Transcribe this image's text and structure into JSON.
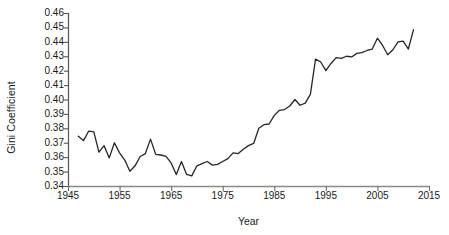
{
  "chart_data": {
    "type": "line",
    "title": "",
    "xlabel": "Year",
    "ylabel": "Gini Coefficient",
    "xlim": [
      1945,
      2015
    ],
    "ylim": [
      0.34,
      0.46
    ],
    "grid": false,
    "legend": "none",
    "xticks": [
      1945,
      1955,
      1965,
      1975,
      1985,
      1995,
      2005,
      2015
    ],
    "yticks": [
      "0.34",
      "0.35",
      "0.36",
      "0.37",
      "0.38",
      "0.39",
      "0.40",
      "0.41",
      "0.42",
      "0.43",
      "0.44",
      "0.45",
      "0.46"
    ],
    "line_color": "#262626",
    "line_width": 1.3,
    "series": [
      {
        "name": "Gini Coefficient",
        "x": [
          1947,
          1948,
          1949,
          1950,
          1951,
          1952,
          1953,
          1954,
          1955,
          1956,
          1957,
          1958,
          1959,
          1960,
          1961,
          1962,
          1963,
          1964,
          1965,
          1966,
          1967,
          1968,
          1969,
          1970,
          1971,
          1972,
          1973,
          1974,
          1975,
          1976,
          1977,
          1978,
          1979,
          1980,
          1981,
          1982,
          1983,
          1984,
          1985,
          1986,
          1987,
          1988,
          1989,
          1990,
          1991,
          1992,
          1993,
          1994,
          1995,
          1996,
          1997,
          1998,
          1999,
          2000,
          2001,
          2002,
          2003,
          2004,
          2005,
          2006,
          2007,
          2008,
          2009,
          2010,
          2011,
          2012
        ],
        "values": [
          0.3745,
          0.3715,
          0.378,
          0.3775,
          0.3635,
          0.368,
          0.3595,
          0.37,
          0.363,
          0.358,
          0.3502,
          0.354,
          0.3605,
          0.3625,
          0.3725,
          0.362,
          0.3615,
          0.3605,
          0.356,
          0.348,
          0.357,
          0.348,
          0.347,
          0.354,
          0.3555,
          0.357,
          0.3545,
          0.355,
          0.357,
          0.359,
          0.363,
          0.3625,
          0.3655,
          0.368,
          0.3695,
          0.38,
          0.3825,
          0.383,
          0.389,
          0.3925,
          0.393,
          0.3955,
          0.4,
          0.396,
          0.3975,
          0.4035,
          0.428,
          0.426,
          0.42,
          0.425,
          0.429,
          0.4285,
          0.43,
          0.4295,
          0.432,
          0.4325,
          0.434,
          0.435,
          0.4425,
          0.4375,
          0.431,
          0.4345,
          0.44,
          0.4405,
          0.435,
          0.4485
        ]
      }
    ]
  },
  "axes": {
    "ylabel_text": "Gini Coefficient",
    "xlabel_text": "Year"
  }
}
